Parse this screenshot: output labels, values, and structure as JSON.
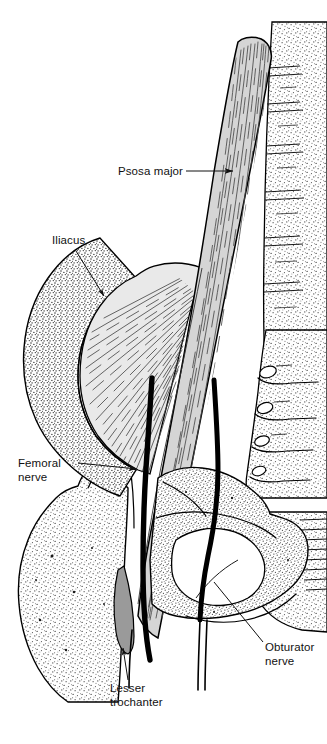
{
  "figure": {
    "background_color": "#ffffff",
    "width": 327,
    "height": 744,
    "line_color": "#000000",
    "muscle_fill_psoas": "#d5d5d5",
    "muscle_fill_iliacus": "#e9e9e9",
    "bone_fill": "#ffffff",
    "stipple_color": "#3a3a3a",
    "nerve_color": "#000000"
  },
  "labels": [
    {
      "id": "psoas-major",
      "text": "Psosa major",
      "lines": [
        "Psosa major"
      ],
      "text_x": 118,
      "text_y": 175,
      "anchor": "start",
      "leader_type": "line-arrow",
      "leader_from": [
        186,
        171
      ],
      "leader_to": [
        235,
        171
      ],
      "points_at": "psoas-major-muscle"
    },
    {
      "id": "iliacus",
      "text": "Iliacus",
      "lines": [
        "Iliacus"
      ],
      "text_x": 52,
      "text_y": 244,
      "anchor": "start",
      "leader_type": "line-arrow",
      "leader_from": [
        76,
        251
      ],
      "leader_to": [
        105,
        298
      ],
      "points_at": "iliacus-muscle"
    },
    {
      "id": "femoral-nerve",
      "text": "Femoral nerve",
      "lines": [
        "Femoral",
        "nerve"
      ],
      "text_x": 18,
      "text_y": 467,
      "anchor": "start",
      "leader_type": "line-arrow",
      "leader_from": [
        71,
        463
      ],
      "leader_to": [
        139,
        470
      ],
      "points_at": "femoral-nerve-cord"
    },
    {
      "id": "obturator-nerve",
      "text": "Obturator nerve",
      "lines": [
        "Obturator",
        "nerve"
      ],
      "text_x": 265,
      "text_y": 651,
      "anchor": "start",
      "leader_type": "line",
      "leader_from": [
        264,
        644
      ],
      "leader_to": [
        215,
        583
      ],
      "points_at": "obturator-nerve-cord"
    },
    {
      "id": "lesser-trochanter",
      "text": "Lesser trochanter",
      "lines": [
        "Lesser",
        "trochanter"
      ],
      "text_x": 110,
      "text_y": 692,
      "anchor": "start",
      "leader_type": "line-arrow",
      "leader_from": [
        128,
        680
      ],
      "leader_to": [
        123,
        645
      ],
      "points_at": "lesser-trochanter-bone"
    }
  ],
  "structures": [
    {
      "id": "psoas-major-muscle",
      "name": "Psoas major muscle",
      "kind": "muscle"
    },
    {
      "id": "iliacus-muscle",
      "name": "Iliacus muscle",
      "kind": "muscle"
    },
    {
      "id": "iliac-crest",
      "name": "Iliac crest",
      "kind": "bone"
    },
    {
      "id": "femur",
      "name": "Femur with greater trochanter",
      "kind": "bone"
    },
    {
      "id": "lesser-trochanter-bone",
      "name": "Lesser trochanter",
      "kind": "bone"
    },
    {
      "id": "pubis-ischium",
      "name": "Pubis and ischium",
      "kind": "bone"
    },
    {
      "id": "obturator-foramen",
      "name": "Obturator foramen",
      "kind": "opening"
    },
    {
      "id": "lumbar-spine",
      "name": "Lumbar vertebral column",
      "kind": "bone"
    },
    {
      "id": "sacrum",
      "name": "Sacrum with anterior sacral foramina",
      "kind": "bone"
    },
    {
      "id": "femoral-nerve-cord",
      "name": "Femoral nerve",
      "kind": "nerve"
    },
    {
      "id": "obturator-nerve-cord",
      "name": "Obturator nerve",
      "kind": "nerve"
    }
  ]
}
